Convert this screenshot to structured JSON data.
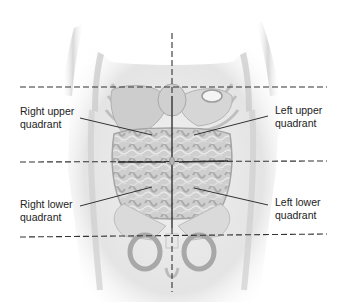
{
  "figure": {
    "labels": {
      "right_upper": [
        "Right upper",
        "quadrant"
      ],
      "left_upper": [
        "Left upper",
        "quadrant"
      ],
      "right_lower": [
        "Right lower",
        "quadrant"
      ],
      "left_lower": [
        "Left lower",
        "quadrant"
      ]
    },
    "colors": {
      "background": "#ffffff",
      "body": "#e6e6e6",
      "organ": "#c9c9c9",
      "organ_dark": "#9e9e9e",
      "guide_line": "#333333",
      "text": "#222222"
    }
  }
}
